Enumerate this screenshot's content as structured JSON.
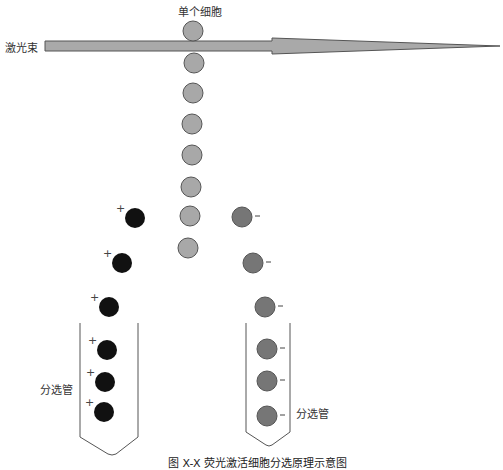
{
  "labels": {
    "single_cell": "单个细胞",
    "laser_beam": "激光束",
    "tube_left": "分选管",
    "tube_right": "分选管",
    "plus": "+",
    "minus": "-",
    "caption": "图 X-X  荧光激活细胞分选原理示意图"
  },
  "colors": {
    "unsorted_cell": "#a8a8a8",
    "positive_cell": "#111111",
    "negative_cell": "#767676",
    "laser_fill": "#a9a9a9",
    "outline": "#555555"
  },
  "cells": {
    "unsorted": [
      {
        "x": 193,
        "y": 31
      },
      {
        "x": 194,
        "y": 63
      },
      {
        "x": 193,
        "y": 93
      },
      {
        "x": 192,
        "y": 124
      },
      {
        "x": 192,
        "y": 155
      },
      {
        "x": 191,
        "y": 187
      },
      {
        "x": 190,
        "y": 216
      },
      {
        "x": 188,
        "y": 248
      }
    ],
    "positive": [
      {
        "x": 135,
        "y": 218
      },
      {
        "x": 122,
        "y": 263
      },
      {
        "x": 109,
        "y": 307
      },
      {
        "x": 107,
        "y": 350
      },
      {
        "x": 105,
        "y": 382
      },
      {
        "x": 104,
        "y": 412
      }
    ],
    "negative": [
      {
        "x": 242,
        "y": 217
      },
      {
        "x": 253,
        "y": 263
      },
      {
        "x": 265,
        "y": 307
      },
      {
        "x": 267,
        "y": 349
      },
      {
        "x": 267,
        "y": 381
      },
      {
        "x": 267,
        "y": 416
      }
    ]
  }
}
